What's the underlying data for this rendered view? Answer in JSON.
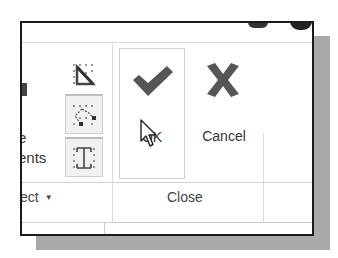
{
  "ribbon": {
    "partial_left_labels": [
      "e",
      "ents"
    ],
    "tools": [
      {
        "name": "trim-corner-tool",
        "icon": "trim-corner-icon"
      },
      {
        "name": "edit-points-tool",
        "icon": "edit-points-icon"
      },
      {
        "name": "symmetry-tool",
        "icon": "symmetry-icon"
      }
    ],
    "ok_label": "OK",
    "cancel_label": "Cancel",
    "groups": {
      "select_partial": "ect",
      "close": "Close"
    }
  },
  "colors": {
    "icon_gray": "#555555",
    "shadow": "#a9a9a9",
    "frame": "#1a1a1a"
  }
}
